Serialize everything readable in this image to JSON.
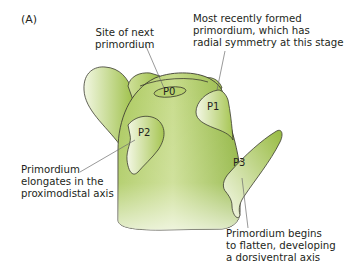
{
  "figure": {
    "panel_label": "(A)",
    "colors": {
      "fill_dark": "#8db33a",
      "fill_light": "#f4f8e6",
      "outline": "#3a3a2e",
      "leader_line": "#6d6d6d",
      "text": "#231f20"
    },
    "primordia": [
      {
        "id": "P0",
        "label": "P0"
      },
      {
        "id": "P1",
        "label": "P1"
      },
      {
        "id": "P2",
        "label": "P2"
      },
      {
        "id": "P3",
        "label": "P3"
      }
    ],
    "annotations": {
      "p0": "Site of next\nprimordium",
      "p1": "Most recently formed\nprimordium, which has\nradial symmetry at this stage",
      "p2": "Primordium\nelongates in the\nproximodistal axis",
      "p3": "Primordium begins\nto flatten, developing\na dorsiventral axis"
    }
  }
}
